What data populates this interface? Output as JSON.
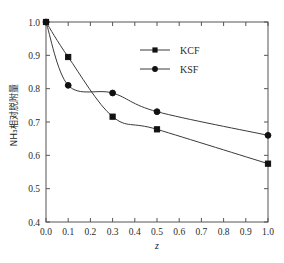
{
  "chart_data": {
    "type": "line",
    "title": "",
    "xlabel": "z",
    "ylabel": "NH3 相对脱附量",
    "ylabel_display": "NH₃相对脱附量",
    "xlim": [
      0.0,
      1.0
    ],
    "ylim": [
      0.4,
      1.0
    ],
    "xticks": [
      "0.0",
      "0.1",
      "0.2",
      "0.3",
      "0.4",
      "0.5",
      "0.6",
      "0.7",
      "0.8",
      "0.9",
      "1.0"
    ],
    "xtick_values": [
      0.0,
      0.1,
      0.2,
      0.3,
      0.4,
      0.5,
      0.6,
      0.7,
      0.8,
      0.9,
      1.0
    ],
    "yticks": [
      "0.4",
      "0.5",
      "0.6",
      "0.7",
      "0.8",
      "0.9",
      "1.0"
    ],
    "ytick_values": [
      0.4,
      0.5,
      0.6,
      0.7,
      0.8,
      0.9,
      1.0
    ],
    "grid": false,
    "legend_position": "top-center",
    "x": [
      0.0,
      0.1,
      0.3,
      0.5,
      1.0
    ],
    "series": [
      {
        "name": "KCF",
        "marker": "square",
        "color": "#1a1a1a",
        "values": [
          1.0,
          0.895,
          0.716,
          0.678,
          0.575
        ]
      },
      {
        "name": "KSF",
        "marker": "circle",
        "color": "#1a1a1a",
        "values": [
          1.0,
          0.81,
          0.787,
          0.731,
          0.66
        ]
      }
    ]
  },
  "legend": {
    "entries": [
      {
        "label": "KCF",
        "marker": "square"
      },
      {
        "label": "KSF",
        "marker": "circle"
      }
    ]
  },
  "axes": {
    "x_axis_label": "z",
    "y_axis_label": "NH₃相对脱附量"
  },
  "colors": {
    "line": "#3a3a3a",
    "marker": "#111111",
    "frame": "#555555",
    "text": "#2b2b2b",
    "background": "#ffffff"
  }
}
